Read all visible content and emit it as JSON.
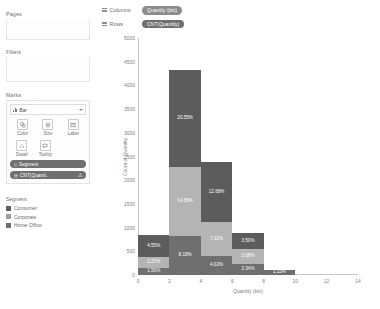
{
  "sidebar": {
    "pages_label": "Pages",
    "filters_label": "Filters",
    "marks_label": "Marks",
    "mark_type": "Bar",
    "properties": [
      {
        "name": "color",
        "label": "Color",
        "icon": "color-icon"
      },
      {
        "name": "size",
        "label": "Size",
        "icon": "size-icon"
      },
      {
        "name": "label",
        "label": "Label",
        "icon": "label-icon"
      },
      {
        "name": "detail",
        "label": "Detail",
        "icon": "detail-icon"
      },
      {
        "name": "tooltip",
        "label": "Tooltip",
        "icon": "tooltip-icon"
      }
    ],
    "mark_pills": [
      {
        "label": "Segment",
        "icon": "color-pill-icon",
        "warn": ""
      },
      {
        "label": "CNT(Quanti..",
        "icon": "label-pill-icon",
        "warn": "⚠"
      }
    ],
    "legend": {
      "title": "Segment",
      "items": [
        {
          "label": "Consumer",
          "color": "#5c5c5c"
        },
        {
          "label": "Corporate",
          "color": "#9e9e9e"
        },
        {
          "label": "Home Office",
          "color": "#6f6f6f"
        }
      ]
    }
  },
  "shelves": {
    "columns_label": "Columns",
    "columns_pill": "Quantity (bin)",
    "rows_label": "Rows",
    "rows_pill": "CNT(Quantity)"
  },
  "chart_data": {
    "type": "bar",
    "title": "",
    "xlabel": "Quantity (bin)",
    "ylabel": "Count of Quantity",
    "xlim": [
      0,
      14
    ],
    "ylim": [
      0,
      5000
    ],
    "grid": false,
    "stacked": true,
    "legend_position": "left",
    "xticks": [
      "0",
      "2",
      "4",
      "6",
      "8",
      "10",
      "12",
      "14"
    ],
    "yticks": [
      "0",
      "500",
      "1000",
      "1500",
      "2000",
      "2500",
      "3000",
      "3500",
      "4000",
      "4500",
      "5000"
    ],
    "categories": [
      "0",
      "2",
      "4",
      "6",
      "8",
      "10"
    ],
    "series": [
      {
        "name": "Consumer",
        "color": "#5c5c5c",
        "values": [
          455,
          2055,
          1268,
          350,
          0,
          0
        ],
        "labels": [
          "4.55%",
          "20.55%",
          "12.68%",
          "3.50%",
          "",
          ""
        ]
      },
      {
        "name": "Corporate",
        "color": "#b4b4b4",
        "values": [
          227,
          1458,
          711,
          308,
          0,
          0
        ],
        "labels": [
          "2.27%",
          "14.58%",
          "7.11%",
          "3.08%",
          "",
          ""
        ]
      },
      {
        "name": "Home Office",
        "color": "#6f6f6f",
        "values": [
          156,
          819,
          402,
          234,
          115,
          0
        ],
        "labels": [
          "1.56%",
          "8.19%",
          "4.02%",
          "2.34%",
          "1.15%",
          ""
        ]
      }
    ]
  }
}
